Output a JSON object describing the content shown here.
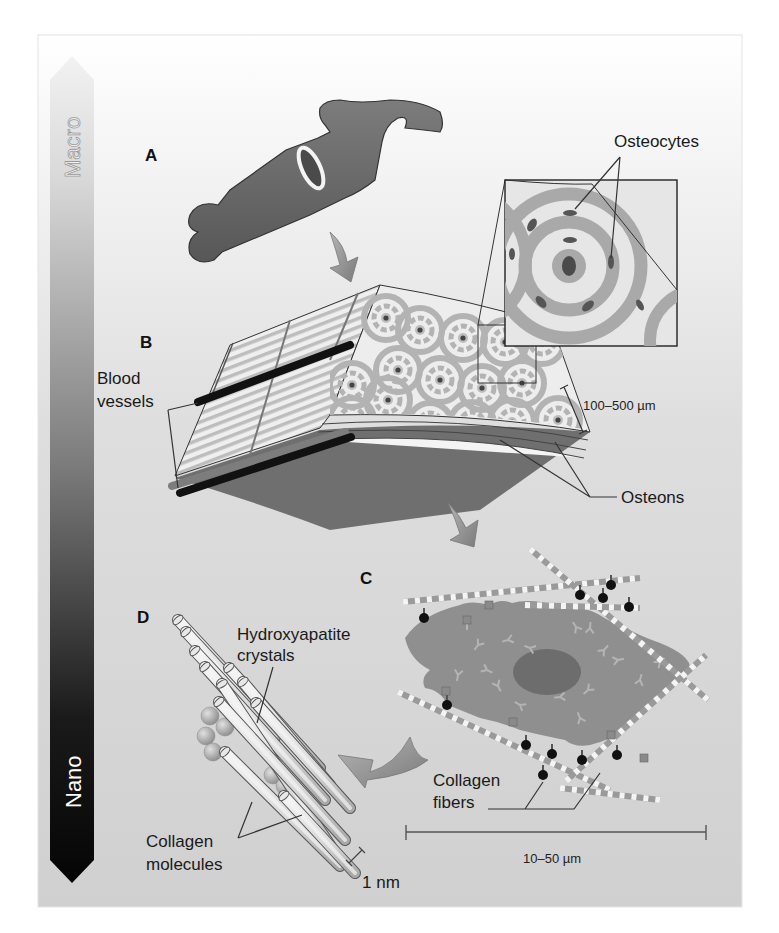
{
  "figure": {
    "scale_bar": {
      "top_label": "Macro",
      "bottom_label": "Nano"
    },
    "panels": {
      "a": {
        "letter": "A"
      },
      "b": {
        "letter": "B"
      },
      "c": {
        "letter": "C"
      },
      "d": {
        "letter": "D"
      }
    },
    "labels": {
      "osteocytes": "Osteocytes",
      "blood_vessels_line1": "Blood",
      "blood_vessels_line2": "vessels",
      "osteons": "Osteons",
      "osteon_scale": "100–500 µm",
      "hydroxyapatite_line1": "Hydroxyapatite",
      "hydroxyapatite_line2": "crystals",
      "collagen_fibers_line1": "Collagen",
      "collagen_fibers_line2": "fibers",
      "cell_scale": "10–50 µm",
      "collagen_molecules_line1": "Collagen",
      "collagen_molecules_line2": "molecules",
      "molecule_scale": "1 nm"
    },
    "colors": {
      "background_top": "#ffffff",
      "background_bottom": "#d2d2d2",
      "bone": "#6b6b6b",
      "osteon_ring": "#a9a9a9",
      "cell_body": "#8f8f8f",
      "nucleus": "#6e6e6e",
      "arrow": "#8a8a8a",
      "scale_bar_top": "#e8e8e8",
      "scale_bar_bottom": "#0a0a0a"
    }
  }
}
